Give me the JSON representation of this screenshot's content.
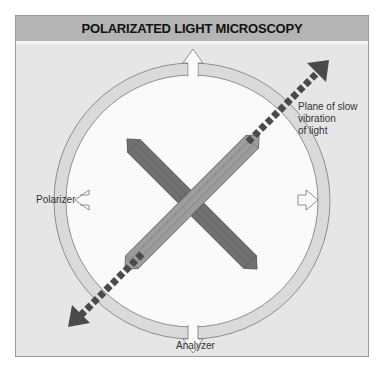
{
  "header": {
    "title": "POLARIZATED LIGHT MICROSCOPY"
  },
  "labels": {
    "plane_line1": "Plane of slow",
    "plane_line2": "vibration",
    "plane_line3": "of light",
    "polarizer": "Polarizer",
    "analyzer": "Analyzer"
  },
  "colors": {
    "background": "#e6e6e6",
    "header": "#b4b4b4",
    "ring": "#d8d8d8",
    "disc": "#fafafa",
    "crystal_dark": "#6e6e6e",
    "crystal_light": "#9a9a9a",
    "dashed_arrow": "#4a4a4a"
  }
}
